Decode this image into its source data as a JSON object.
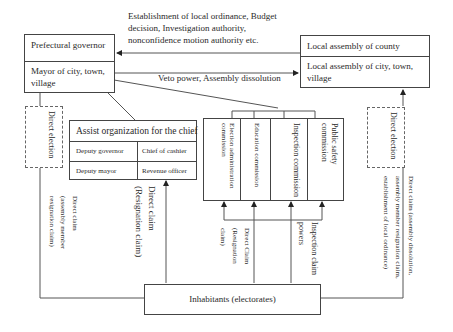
{
  "top_annotation": {
    "lines": [
      "Establishment of local ordinance, Budget",
      "decision, Investigation authority,",
      "nonconfidence motion authority etc."
    ]
  },
  "executive": {
    "top": "Prefectural governor",
    "bottom_line1": "Mayor of city, town,",
    "bottom_line2": "village"
  },
  "assembly": {
    "top": "Local assembly of county",
    "bottom_line1": "Local assembly of city, town,",
    "bottom_line2": "village"
  },
  "veto_label": "Veto power, Assembly dissolution",
  "left_direct_election": "Direct election",
  "right_direct_election": "Direct election",
  "assist_org": {
    "title": "Assist organization for the chief",
    "rows": [
      [
        "Deputy governor",
        "Chief of cashier"
      ],
      [
        "Deputy mayor",
        "Revenue officer"
      ]
    ]
  },
  "commissions": [
    "Election administration commission",
    "Education commission",
    "Inspection commission",
    "Public safety commission"
  ],
  "claims": {
    "left_assembly_member": [
      "Direct claim",
      "(assembly member",
      "resignation claim)"
    ],
    "chief_resignation": [
      "Direct claim",
      "(Resignation claim)"
    ],
    "commission_resignation": [
      "Direct  Claim",
      "(Resignation",
      "claim)"
    ],
    "inspection": [
      "Inspection claim",
      "powers"
    ],
    "right_assembly": [
      "Direct claim (assembly dissolution,",
      "assembly member resignation claim,",
      "establishment of local ordinance)"
    ]
  },
  "inhabitants": "Inhabitants (electorates)"
}
